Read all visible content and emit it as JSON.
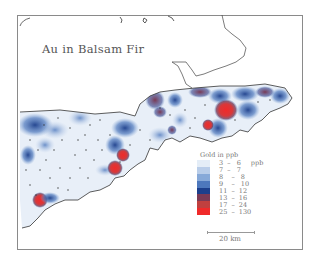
{
  "map": {
    "title": "Au in Balsam Fir",
    "legend": {
      "title": "Gold  in  ppb",
      "unit": "ppb",
      "classes": [
        {
          "range": "3  –   6",
          "unit": "ppb",
          "color": "#e4edf7"
        },
        {
          "range": "7  –   7",
          "unit": "",
          "color": "#b9cde9"
        },
        {
          "range": "8    –   8",
          "unit": "",
          "color": "#87a9d8"
        },
        {
          "range": "9    –   10",
          "unit": "",
          "color": "#4d78bd"
        },
        {
          "range": "11  –  12",
          "unit": "",
          "color": "#1c3f8c"
        },
        {
          "range": "13  –  16",
          "unit": "",
          "color": "#7a3a55"
        },
        {
          "range": "17  –  24",
          "unit": "",
          "color": "#c0403f"
        },
        {
          "range": "25  –  130",
          "unit": "",
          "color": "#f02a2a"
        }
      ]
    },
    "scale_bar": {
      "label": "20  km"
    },
    "colors": {
      "land": "#e8eff8",
      "coast": "#333333",
      "frame": "#8a8a8a",
      "sample_dot": "#333333"
    }
  }
}
